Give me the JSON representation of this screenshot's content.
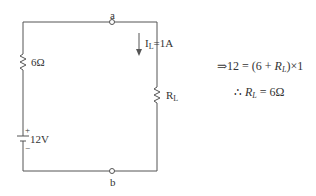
{
  "circuit": {
    "node_top": "a",
    "node_bottom": "b",
    "resistor_series": "6Ω",
    "source": {
      "value": "12V",
      "plus": "+",
      "minus": "−"
    },
    "current": {
      "symbol": "I",
      "subscript": "L",
      "value": "=1A"
    },
    "load": {
      "symbol": "R",
      "subscript": "L"
    }
  },
  "equations": {
    "line1": {
      "prefix": "⇒12 = (6 + ",
      "var": "R",
      "sub": "L",
      "suffix": ")×1"
    },
    "line2": {
      "prefix": "∴ ",
      "var": "R",
      "sub": "L",
      "suffix": " = 6Ω"
    }
  },
  "colors": {
    "wire": "#555555",
    "text": "#333333"
  }
}
